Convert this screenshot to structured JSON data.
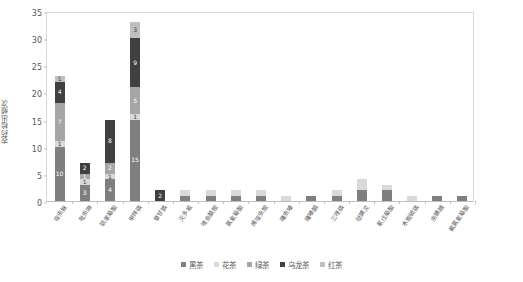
{
  "chart_data": {
    "type": "bar",
    "subtype": "stacked-bar",
    "title": "",
    "xlabel": "",
    "ylabel": "农药检出频次",
    "ylim": [
      0,
      35
    ],
    "ytick_step": 5,
    "yticks": [
      "35",
      "30",
      "25",
      "20",
      "15",
      "10",
      "5",
      "0"
    ],
    "grid": false,
    "legend_position": "bottom",
    "categories": [
      "啶虫脒",
      "吡虫啉",
      "联苯菊酯",
      "甲拌磷",
      "草甘膦",
      "灭多威",
      "唑虫酰胺",
      "氯氰菊酯",
      "烯啶虫胺",
      "噻虫嗪",
      "噻嗪酮",
      "三唑磷",
      "哒螨灵",
      "氰戊菊酯",
      "水胺硫磷",
      "虫螨腈",
      "氟氯氰菊酯"
    ],
    "series": [
      {
        "name": "黑茶",
        "color": "#7f7f7f",
        "values": [
          10,
          3,
          4,
          15,
          0,
          1,
          1,
          1,
          1,
          0,
          1,
          1,
          2,
          2,
          0,
          1,
          1
        ]
      },
      {
        "name": "花茶",
        "color": "#d9d9d9",
        "values": [
          1,
          1,
          1,
          1,
          0,
          1,
          1,
          1,
          1,
          1,
          0,
          1,
          2,
          1,
          1,
          0,
          0
        ]
      },
      {
        "name": "绿茶",
        "color": "#a6a6a6",
        "values": [
          7,
          1,
          2,
          5,
          0,
          0,
          0,
          0,
          0,
          0,
          0,
          0,
          0,
          0,
          0,
          0,
          0
        ]
      },
      {
        "name": "乌龙茶",
        "color": "#404040",
        "values": [
          4,
          2,
          8,
          9,
          2,
          0,
          0,
          0,
          0,
          0,
          0,
          0,
          0,
          0,
          0,
          0,
          0
        ]
      },
      {
        "name": "红茶",
        "color": "#bfbfbf",
        "values": [
          1,
          0,
          0,
          3,
          0,
          0,
          0,
          0,
          0,
          0,
          0,
          0,
          0,
          0,
          0,
          0,
          0
        ]
      }
    ],
    "bar_totals": [
      23,
      7,
      15,
      33,
      2,
      2,
      2,
      2,
      2,
      1,
      1,
      2,
      4,
      3,
      1,
      1,
      1
    ],
    "segment_labels": {
      "0": {
        "黑茶": "10",
        "花茶": "1",
        "绿茶": "7",
        "乌龙茶": "4",
        "红茶": "1"
      },
      "1": {
        "黑茶": "3",
        "花茶": "1",
        "绿茶": "1",
        "乌龙茶": "2"
      },
      "2": {
        "黑茶": "4",
        "花茶": "1",
        "绿茶": "2",
        "乌龙茶": "8"
      },
      "3": {
        "黑茶": "15",
        "花茶": "1",
        "绿茶": "5",
        "乌龙茶": "9",
        "红茶": "3"
      },
      "4": {
        "乌龙茶": "2"
      }
    }
  },
  "legend": {
    "items": [
      {
        "label": "黑茶",
        "color": "#7f7f7f"
      },
      {
        "label": "花茶",
        "color": "#d9d9d9"
      },
      {
        "label": "绿茶",
        "color": "#a6a6a6"
      },
      {
        "label": "乌龙茶",
        "color": "#404040"
      },
      {
        "label": "红茶",
        "color": "#bfbfbf"
      }
    ]
  },
  "axis": {
    "y_title": "农药检出频次"
  }
}
